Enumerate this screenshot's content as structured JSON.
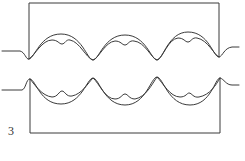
{
  "figure": {
    "label": "3",
    "stroke_color": "#3a3a3a",
    "background": "#ffffff",
    "upper_wave": {
      "arches": 3,
      "orientation": "up"
    },
    "lower_wave": {
      "arches": 3,
      "orientation": "down"
    }
  }
}
